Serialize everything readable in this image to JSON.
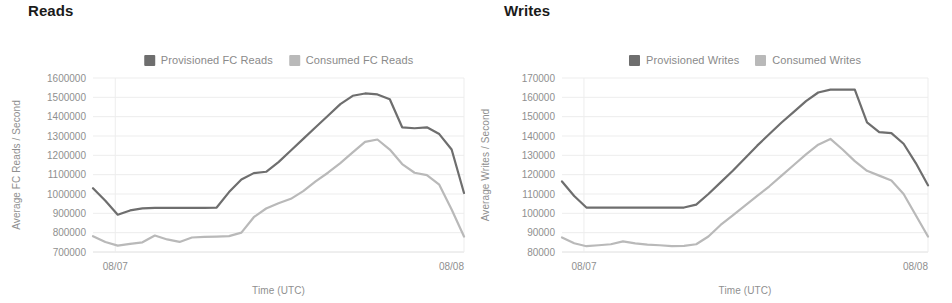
{
  "panels": [
    {
      "id": "reads",
      "title": "Reads",
      "legend": [
        {
          "label": "Provisioned FC Reads",
          "color": "#6e6e6e",
          "swatch": "legend-swatch-provisioned"
        },
        {
          "label": "Consumed FC Reads",
          "color": "#b9b9b9",
          "swatch": "legend-swatch-consumed"
        }
      ],
      "chart_data": {
        "type": "line",
        "title": "Reads",
        "xlabel": "Time (UTC)",
        "ylabel": "Average FC Reads / Second",
        "grid": true,
        "legend_position": "top-center",
        "ylim": [
          700000,
          1600000
        ],
        "yticks": [
          700000,
          800000,
          900000,
          1000000,
          1100000,
          1200000,
          1300000,
          1400000,
          1500000,
          1600000
        ],
        "ytick_labels": [
          "700000",
          "800000",
          "900000",
          "1000000",
          "1100000",
          "1200000",
          "1300000",
          "1400000",
          "1500000",
          "1600000"
        ],
        "xticks": [
          0.06,
          1.0
        ],
        "xtick_labels": [
          "08/07",
          "08/08"
        ],
        "xlim": [
          0,
          1
        ],
        "x": [
          0.0,
          0.03,
          0.06,
          0.09,
          0.12,
          0.15,
          0.18,
          0.21,
          0.25,
          0.3,
          0.34,
          0.37,
          0.4,
          0.43,
          0.46,
          0.49,
          0.53,
          0.57,
          0.61,
          0.65,
          0.69,
          0.73,
          0.77,
          0.8,
          0.83,
          0.86,
          0.89,
          0.92,
          0.96,
          1.0
        ],
        "series": [
          {
            "name": "Provisioned FC Reads",
            "color": "#6e6e6e",
            "values": [
              1030000,
              965000,
              893000,
              915000,
              926000,
              928000,
              928000,
              928000,
              928000,
              928000,
              930000,
              1010000,
              1075000,
              1108000,
              1115000,
              1165000,
              1225000,
              1285000,
              1345000,
              1405000,
              1465000,
              1508000,
              1520000,
              1515000,
              1490000,
              1345000,
              1340000,
              1345000,
              1310000,
              1230000,
              1005000
            ]
          },
          {
            "name": "Consumed FC Reads",
            "color": "#b9b9b9",
            "values": [
              782000,
              752000,
              733000,
              742000,
              750000,
              785000,
              765000,
              752000,
              775000,
              778000,
              780000,
              782000,
              800000,
              880000,
              925000,
              952000,
              975000,
              1015000,
              1065000,
              1110000,
              1160000,
              1215000,
              1270000,
              1282000,
              1230000,
              1155000,
              1110000,
              1098000,
              1048000,
              920000,
              780000
            ]
          }
        ]
      }
    },
    {
      "id": "writes",
      "title": "Writes",
      "legend": [
        {
          "label": "Provisioned Writes",
          "color": "#6e6e6e",
          "swatch": "legend-swatch-provisioned"
        },
        {
          "label": "Consumed Writes",
          "color": "#b9b9b9",
          "swatch": "legend-swatch-consumed"
        }
      ],
      "chart_data": {
        "type": "line",
        "title": "Writes",
        "xlabel": "Time (UTC)",
        "ylabel": "Average Writes / Second",
        "grid": true,
        "legend_position": "top-center",
        "ylim": [
          80000,
          170000
        ],
        "yticks": [
          80000,
          90000,
          100000,
          110000,
          120000,
          130000,
          140000,
          150000,
          160000,
          170000
        ],
        "ytick_labels": [
          "80000",
          "90000",
          "100000",
          "110000",
          "120000",
          "130000",
          "140000",
          "150000",
          "160000",
          "170000"
        ],
        "xticks": [
          0.06,
          1.0
        ],
        "xtick_labels": [
          "08/07",
          "08/08"
        ],
        "xlim": [
          0,
          1
        ],
        "x": [
          0.0,
          0.03,
          0.06,
          0.09,
          0.12,
          0.15,
          0.18,
          0.21,
          0.25,
          0.3,
          0.34,
          0.37,
          0.4,
          0.43,
          0.46,
          0.49,
          0.53,
          0.57,
          0.61,
          0.65,
          0.69,
          0.73,
          0.77,
          0.8,
          0.83,
          0.86,
          0.89,
          0.92,
          0.96,
          1.0
        ],
        "series": [
          {
            "name": "Provisioned Writes",
            "color": "#6e6e6e",
            "values": [
              116500,
              109000,
              103000,
              103000,
              103000,
              103000,
              103000,
              103000,
              103000,
              103000,
              103000,
              104500,
              110000,
              116000,
              122000,
              128500,
              135000,
              141000,
              147000,
              152500,
              158000,
              162500,
              164000,
              164000,
              164000,
              147000,
              142000,
              141500,
              136000,
              126000,
              114500
            ]
          },
          {
            "name": "Consumed Writes",
            "color": "#b9b9b9",
            "values": [
              87500,
              84500,
              83000,
              83500,
              84000,
              85500,
              84500,
              83800,
              83500,
              83000,
              83200,
              84000,
              88000,
              94000,
              99000,
              104000,
              109000,
              114000,
              119500,
              125000,
              130500,
              135500,
              138500,
              133000,
              127000,
              122000,
              119500,
              117000,
              110000,
              99000,
              88000
            ]
          }
        ]
      }
    }
  ]
}
